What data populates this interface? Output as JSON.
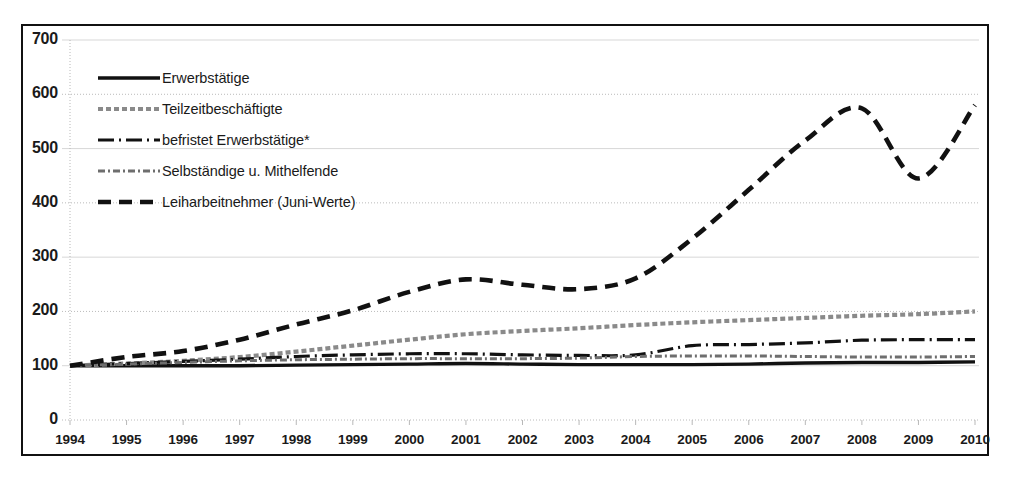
{
  "chart_data": {
    "type": "line",
    "title": "",
    "subtitle": "",
    "xlabel": "",
    "ylabel": "",
    "xlim": [
      1994,
      2010
    ],
    "ylim": [
      0,
      700
    ],
    "ytick_step": 100,
    "grid": true,
    "legend_position": "upper-left-inside",
    "index_note": "1994 = 100",
    "categories": [
      1994,
      1995,
      1996,
      1997,
      1998,
      1999,
      2000,
      2001,
      2002,
      2003,
      2004,
      2005,
      2006,
      2007,
      2008,
      2009,
      2010
    ],
    "yticks": [
      0,
      100,
      200,
      300,
      400,
      500,
      600,
      700
    ],
    "xticks": [
      "1994",
      "1995",
      "1996",
      "1997",
      "1998",
      "1999",
      "2000",
      "2001",
      "2002",
      "2003",
      "2004",
      "2005",
      "2006",
      "2007",
      "2008",
      "2009",
      "2010"
    ],
    "series": [
      {
        "name": "Erwerbstätige",
        "style": "solid",
        "color": "#111111",
        "width": 3.4,
        "values": [
          100,
          100,
          100,
          100,
          101,
          102,
          103,
          104,
          103,
          102,
          102,
          102,
          103,
          105,
          106,
          106,
          107
        ]
      },
      {
        "name": "Teilzeitbeschäftigte",
        "style": "fine-dotted",
        "color": "#8a8a8a",
        "width": 4.2,
        "values": [
          100,
          104,
          109,
          116,
          126,
          137,
          148,
          158,
          164,
          169,
          175,
          180,
          184,
          188,
          192,
          195,
          200
        ]
      },
      {
        "name": "befristet Erwerbstätige*",
        "style": "dash-dot",
        "color": "#111111",
        "width": 3.2,
        "values": [
          100,
          104,
          108,
          112,
          117,
          120,
          122,
          122,
          120,
          119,
          120,
          137,
          139,
          142,
          147,
          148,
          148
        ]
      },
      {
        "name": "Selbständige u. Mithelfende",
        "style": "gray-dash-dot",
        "color": "#6e6e6e",
        "width": 3.0,
        "values": [
          100,
          103,
          106,
          109,
          111,
          112,
          113,
          113,
          113,
          114,
          117,
          118,
          118,
          117,
          116,
          116,
          117
        ]
      },
      {
        "name": "Leiharbeitnehmer (Juni-Werte)",
        "style": "long-dash",
        "color": "#111111",
        "width": 4.6,
        "values": [
          100,
          116,
          127,
          148,
          176,
          202,
          236,
          259,
          249,
          241,
          261,
          334,
          424,
          515,
          574,
          445,
          580
        ]
      }
    ]
  },
  "legend": {
    "items": [
      {
        "label": "Erwerbstätige",
        "swatch": "legend-swatch-solid"
      },
      {
        "label": "Teilzeitbeschäftigte",
        "swatch": "legend-swatch-fine-dotted"
      },
      {
        "label": "befristet Erwerbstätige*",
        "swatch": "legend-swatch-dash-dot"
      },
      {
        "label": "Selbständige u. Mithelfende",
        "swatch": "legend-swatch-gray-dash-dot"
      },
      {
        "label": "Leiharbeitnehmer (Juni-Werte)",
        "swatch": "legend-swatch-long-dash"
      }
    ]
  },
  "colors": {
    "axis": "#111111",
    "grid": "#b8b8b8",
    "background": "#ffffff",
    "text": "#1a1a1a"
  }
}
